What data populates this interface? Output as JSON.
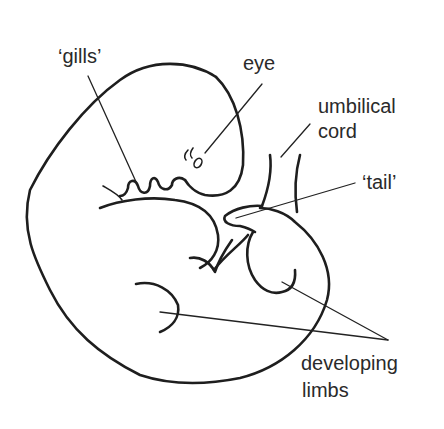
{
  "diagram": {
    "labels": {
      "gills": "‘gills’",
      "eye": "eye",
      "umbilical_line1": "umbilical",
      "umbilical_line2": "cord",
      "tail": "‘tail’",
      "limbs_line1": "developing",
      "limbs_line2": "limbs"
    },
    "colors": {
      "background": "#ffffff",
      "stroke": "#1e1e1e",
      "text": "#2a2a2a"
    }
  }
}
